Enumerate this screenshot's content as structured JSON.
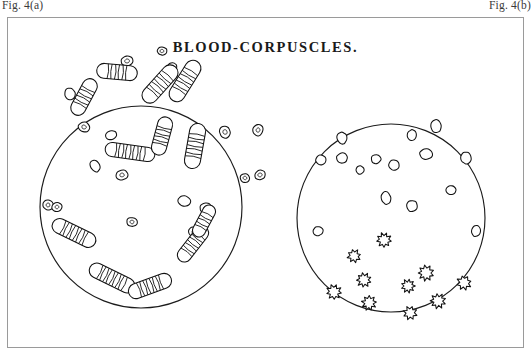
{
  "figure": {
    "label_left": "Fig. 4(a)",
    "label_right": "Fig. 4(b)",
    "title": "BLOOD-CORPUSCLES.",
    "frame": {
      "x": 7,
      "y": 17,
      "width": 517,
      "height": 331,
      "border_color": "#9a9a9a"
    },
    "background_color": "#ffffff",
    "ink_color": "#111111"
  },
  "panels": [
    {
      "id": "panel-left",
      "name": "left-blood-field",
      "description": "Rouleaux of blood corpuscles",
      "circle": {
        "cx": 133,
        "cy": 189,
        "r": 101
      },
      "round_cells": [
        {
          "cx": 62,
          "cy": 76,
          "rx": 5.2,
          "ry": 6.0,
          "rot": -18,
          "nucleus": false
        },
        {
          "cx": 76,
          "cy": 109,
          "rx": 6.0,
          "ry": 5.0,
          "rot": 12,
          "nucleus": true
        },
        {
          "cx": 119,
          "cy": 43,
          "rx": 6.2,
          "ry": 5.0,
          "rot": -8,
          "nucleus": true
        },
        {
          "cx": 154,
          "cy": 33,
          "rx": 5.0,
          "ry": 4.2,
          "rot": 0,
          "nucleus": true
        },
        {
          "cx": 164,
          "cy": 50,
          "rx": 4.8,
          "ry": 5.6,
          "rot": 25,
          "nucleus": false
        },
        {
          "cx": 114,
          "cy": 157,
          "rx": 6.0,
          "ry": 5.0,
          "rot": -10,
          "nucleus": true
        },
        {
          "cx": 124,
          "cy": 204,
          "rx": 5.4,
          "ry": 4.6,
          "rot": 6,
          "nucleus": true
        },
        {
          "cx": 103,
          "cy": 117,
          "rx": 5.6,
          "ry": 4.6,
          "rot": -15,
          "nucleus": false
        },
        {
          "cx": 176,
          "cy": 183,
          "rx": 6.4,
          "ry": 5.2,
          "rot": 8,
          "nucleus": false
        },
        {
          "cx": 198,
          "cy": 190,
          "rx": 6.0,
          "ry": 5.2,
          "rot": -5,
          "nucleus": true
        },
        {
          "cx": 186,
          "cy": 214,
          "rx": 5.6,
          "ry": 5.0,
          "rot": 14,
          "nucleus": true
        },
        {
          "cx": 252,
          "cy": 157,
          "rx": 5.6,
          "ry": 4.8,
          "rot": -12,
          "nucleus": true
        },
        {
          "cx": 237,
          "cy": 160,
          "rx": 5.0,
          "ry": 4.4,
          "rot": 10,
          "nucleus": true
        },
        {
          "cx": 250,
          "cy": 112,
          "rx": 5.2,
          "ry": 5.8,
          "rot": 20,
          "nucleus": true
        },
        {
          "cx": 217,
          "cy": 114,
          "rx": 5.4,
          "ry": 6.4,
          "rot": -22,
          "nucleus": true
        },
        {
          "cx": 40,
          "cy": 187,
          "rx": 5.4,
          "ry": 5.0,
          "rot": 30,
          "nucleus": true
        },
        {
          "cx": 49,
          "cy": 189,
          "rx": 5.0,
          "ry": 4.6,
          "rot": -20,
          "nucleus": true
        },
        {
          "cx": 87,
          "cy": 148,
          "rx": 4.6,
          "ry": 6.2,
          "rot": -30,
          "nucleus": false
        }
      ],
      "rouleaux": [
        {
          "cx": 109,
          "cy": 54,
          "len": 26,
          "w": 15,
          "rot": 5,
          "n": 7
        },
        {
          "cx": 152,
          "cy": 66,
          "len": 30,
          "w": 16,
          "rot": -48,
          "n": 8
        },
        {
          "cx": 177,
          "cy": 63,
          "len": 30,
          "w": 16,
          "rot": -58,
          "n": 8
        },
        {
          "cx": 76,
          "cy": 79,
          "len": 25,
          "w": 15,
          "rot": -62,
          "n": 7
        },
        {
          "cx": 122,
          "cy": 134,
          "len": 36,
          "w": 14,
          "rot": 8,
          "n": 10
        },
        {
          "cx": 154,
          "cy": 118,
          "len": 24,
          "w": 15,
          "rot": -75,
          "n": 7
        },
        {
          "cx": 187,
          "cy": 128,
          "len": 30,
          "w": 16,
          "rot": -80,
          "n": 8
        },
        {
          "cx": 66,
          "cy": 215,
          "len": 32,
          "w": 15,
          "rot": 26,
          "n": 9
        },
        {
          "cx": 185,
          "cy": 226,
          "len": 28,
          "w": 14,
          "rot": -52,
          "n": 8
        },
        {
          "cx": 196,
          "cy": 203,
          "len": 22,
          "w": 13,
          "rot": -62,
          "n": 6
        },
        {
          "cx": 104,
          "cy": 260,
          "len": 34,
          "w": 15,
          "rot": 26,
          "n": 10
        },
        {
          "cx": 142,
          "cy": 268,
          "len": 30,
          "w": 15,
          "rot": -20,
          "n": 9
        }
      ]
    },
    {
      "id": "panel-right",
      "name": "right-blood-field",
      "description": "Isolated and crenated blood corpuscles",
      "circle": {
        "cx": 383,
        "cy": 200,
        "r": 94
      },
      "round_cells": [
        {
          "cx": 334,
          "cy": 120,
          "rx": 5.0,
          "ry": 6.0,
          "rot": -10
        },
        {
          "cx": 404,
          "cy": 117,
          "rx": 4.8,
          "ry": 5.4,
          "rot": 8
        },
        {
          "cx": 428,
          "cy": 108,
          "rx": 5.4,
          "ry": 6.4,
          "rot": -6
        },
        {
          "cx": 313,
          "cy": 142,
          "rx": 5.4,
          "ry": 4.8,
          "rot": 14
        },
        {
          "cx": 334,
          "cy": 140,
          "rx": 5.6,
          "ry": 5.0,
          "rot": -8
        },
        {
          "cx": 368,
          "cy": 141,
          "rx": 5.0,
          "ry": 4.6,
          "rot": 5
        },
        {
          "cx": 386,
          "cy": 147,
          "rx": 5.2,
          "ry": 5.2,
          "rot": 0
        },
        {
          "cx": 418,
          "cy": 136,
          "rx": 6.4,
          "ry": 5.4,
          "rot": 10
        },
        {
          "cx": 458,
          "cy": 140,
          "rx": 5.2,
          "ry": 6.0,
          "rot": -12
        },
        {
          "cx": 352,
          "cy": 152,
          "rx": 4.0,
          "ry": 4.2,
          "rot": 0
        },
        {
          "cx": 443,
          "cy": 172,
          "rx": 5.0,
          "ry": 4.6,
          "rot": 16
        },
        {
          "cx": 378,
          "cy": 180,
          "rx": 4.8,
          "ry": 6.4,
          "rot": -8
        },
        {
          "cx": 404,
          "cy": 188,
          "rx": 5.6,
          "ry": 5.6,
          "rot": 6
        },
        {
          "cx": 310,
          "cy": 213,
          "rx": 5.2,
          "ry": 4.6,
          "rot": -14
        },
        {
          "cx": 468,
          "cy": 213,
          "rx": 4.8,
          "ry": 5.6,
          "rot": 10
        }
      ],
      "crenated_cells": [
        {
          "cx": 376,
          "cy": 222,
          "r": 7.0,
          "rot": 10,
          "points": 9
        },
        {
          "cx": 418,
          "cy": 255,
          "r": 7.4,
          "rot": -20,
          "points": 9
        },
        {
          "cx": 456,
          "cy": 265,
          "r": 7.0,
          "rot": 30,
          "points": 8
        },
        {
          "cx": 400,
          "cy": 268,
          "r": 6.6,
          "rot": 0,
          "points": 9
        },
        {
          "cx": 356,
          "cy": 262,
          "r": 7.0,
          "rot": 18,
          "points": 9
        },
        {
          "cx": 346,
          "cy": 238,
          "r": 6.4,
          "rot": -14,
          "points": 8
        },
        {
          "cx": 326,
          "cy": 274,
          "r": 7.2,
          "rot": 8,
          "points": 9
        },
        {
          "cx": 361,
          "cy": 285,
          "r": 7.0,
          "rot": -8,
          "points": 9
        },
        {
          "cx": 430,
          "cy": 283,
          "r": 7.2,
          "rot": 22,
          "points": 9
        },
        {
          "cx": 402,
          "cy": 295,
          "r": 6.6,
          "rot": -26,
          "points": 8
        }
      ]
    }
  ]
}
